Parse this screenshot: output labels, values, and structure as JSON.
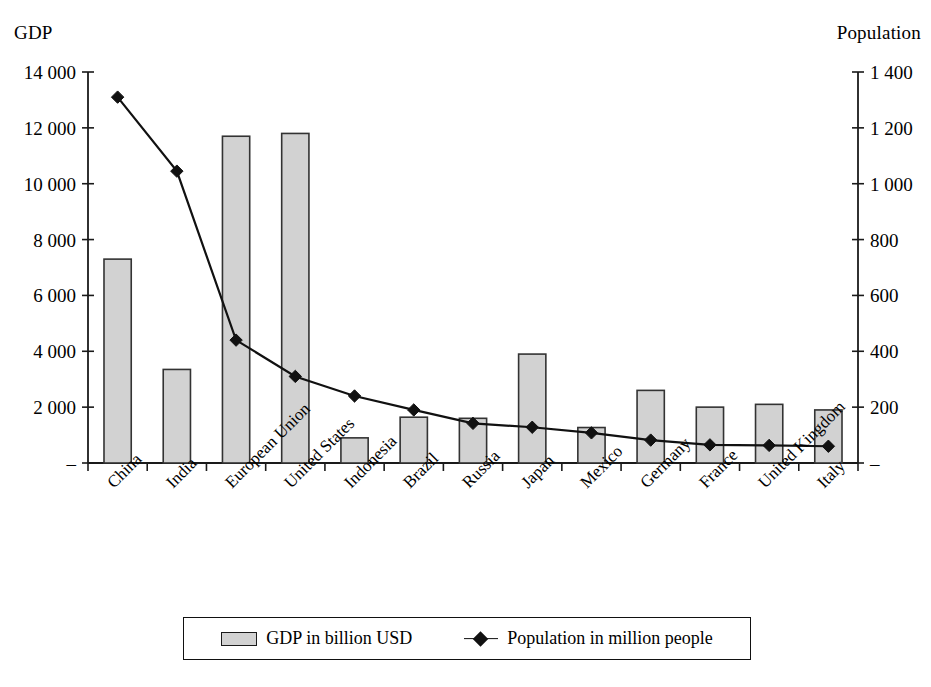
{
  "chart_data": {
    "type": "bar",
    "title": "",
    "subtitle": "",
    "xlabel": "",
    "ylabel": "GDP",
    "y2label": "Population",
    "grid": false,
    "legend_position": "bottom",
    "categories": [
      "China",
      "India",
      "European Union",
      "United States",
      "Indonesia",
      "Brazil",
      "Russia",
      "Japan",
      "Mexico",
      "Germany",
      "France",
      "United Kingdom",
      "Italy"
    ],
    "series": [
      {
        "name": "GDP in billion USD",
        "type": "bar",
        "axis": "left",
        "values": [
          7300,
          3350,
          11700,
          11800,
          900,
          1640,
          1600,
          3900,
          1270,
          2600,
          2000,
          2100,
          1900
        ]
      },
      {
        "name": "Population in million people",
        "type": "line",
        "axis": "right",
        "marker": "diamond",
        "values": [
          1310,
          1045,
          440,
          310,
          240,
          190,
          142,
          128,
          108,
          82,
          65,
          63,
          60
        ]
      }
    ],
    "ylim": [
      0,
      14000
    ],
    "yticks": [
      0,
      2000,
      4000,
      6000,
      8000,
      10000,
      12000,
      14000
    ],
    "ytick_labels": [
      "–",
      "2 000",
      "4 000",
      "6 000",
      "8 000",
      "10 000",
      "12 000",
      "14 000"
    ],
    "y2lim": [
      0,
      1400
    ],
    "y2ticks": [
      0,
      200,
      400,
      600,
      800,
      1000,
      1200,
      1400
    ],
    "y2tick_labels": [
      "–",
      "200",
      "400",
      "600",
      "800",
      "1 000",
      "1 200",
      "1 400"
    ]
  },
  "legend": {
    "items": [
      {
        "label": "GDP in billion USD",
        "marker": "bar-swatch",
        "color": "#d2d2d2"
      },
      {
        "label": "Population in million people",
        "marker": "line-diamond",
        "color": "#111111"
      }
    ]
  },
  "colors": {
    "bar_fill": "#d2d2d2",
    "bar_stroke": "#333333",
    "line": "#111111",
    "axis": "#1a1a1a",
    "text": "#000000",
    "background": "#ffffff"
  }
}
